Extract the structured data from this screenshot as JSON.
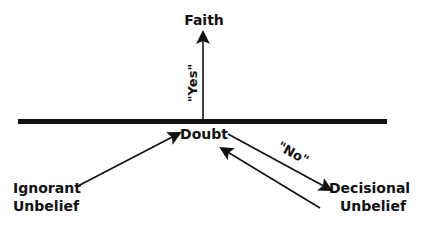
{
  "diagram": {
    "colors": {
      "background": "#ffffff",
      "ink": "#111111"
    },
    "nodes": {
      "faith": {
        "label": "Faith"
      },
      "doubt": {
        "label": "Doubt"
      },
      "ignorant_unbelief": {
        "line1": "Ignorant",
        "line2": "Unbelief"
      },
      "decisional_unbelief": {
        "line1": "Decisional",
        "line2": "Unbelief"
      }
    },
    "edges": {
      "doubt_to_faith": {
        "label": "\"Yes\""
      },
      "doubt_to_decisional": {
        "label": "\"No\""
      },
      "ignorant_to_doubt": {
        "label": ""
      },
      "decisional_to_doubt": {
        "label": ""
      }
    },
    "divider": {
      "name": "threshold-line"
    }
  }
}
